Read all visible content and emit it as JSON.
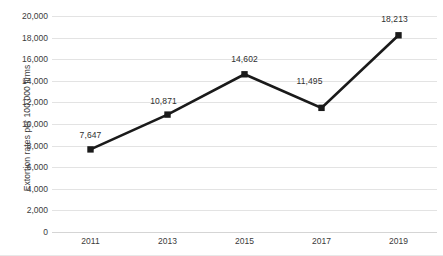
{
  "chart_data": {
    "type": "line",
    "title": "",
    "subtitle": "",
    "xlabel": "",
    "ylabel": "Extortion rates per 100,000 firms",
    "categories": [
      "2011",
      "2013",
      "2015",
      "2017",
      "2019"
    ],
    "values": [
      7647,
      10871,
      14602,
      11495,
      18213
    ],
    "point_labels": [
      "7,647",
      "10,871",
      "14,602",
      "11,495",
      "18,213"
    ],
    "series": [
      {
        "name": "Extortion rates per 100,000 firms",
        "values": [
          7647,
          10871,
          14602,
          11495,
          18213
        ]
      }
    ],
    "ylim": [
      0,
      20000
    ],
    "ytick_values": [
      0,
      2000,
      4000,
      6000,
      8000,
      10000,
      12000,
      14000,
      16000,
      18000,
      20000
    ],
    "ytick_labels": [
      "0",
      "2,000",
      "4,000",
      "6,000",
      "8,000",
      "10,000",
      "12,000",
      "14,000",
      "16,000",
      "18,000",
      "20,000"
    ],
    "xtick_labels": [
      "2011",
      "2013",
      "2015",
      "2017",
      "2019"
    ],
    "grid": "horizontal",
    "legend": "none",
    "marker": "square",
    "line_color": "#1a1a1a",
    "marker_color": "#1a1a1a",
    "gridline_color": "#e3e3e3",
    "text_color": "#3b3b3b",
    "background_color": "#ffffff"
  }
}
